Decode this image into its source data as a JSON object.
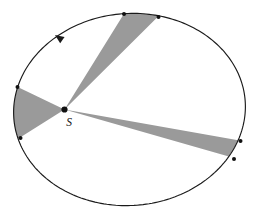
{
  "figure": {
    "type": "kepler-second-law-orbit-diagram",
    "background_color": "#ffffff"
  },
  "orbit": {
    "name": "elliptical-orbit",
    "stroke_color": "#1a1a1a",
    "stroke_width": 1.15,
    "center_x": 129.5,
    "center_y": 109.5,
    "radius_x": 116,
    "radius_y": 96,
    "rotation_deg": -4.5
  },
  "focus": {
    "label": "S",
    "label_x": 69,
    "label_y": 126,
    "dot_x": 64.5,
    "dot_y": 109.5,
    "dot_radius": 3.1,
    "dot_color": "#111111"
  },
  "direction_arrow": {
    "label": "counterclockwise-orbit-direction",
    "tip_x": 55,
    "tip_y": 35,
    "angle_deg": 215,
    "color": "#1a1a1a",
    "size": 9
  },
  "sectors": {
    "fill_color": "#9a9a9a",
    "items": [
      {
        "name": "sector-top",
        "p1_x": 124.0,
        "p1_y": 14.0,
        "p2_x": 158.5,
        "p2_y": 17.0,
        "arc_sweep": 1
      },
      {
        "name": "sector-left",
        "p1_x": 17.5,
        "p1_y": 87.0,
        "p2_x": 20.5,
        "p2_y": 138.0,
        "arc_sweep": 1
      },
      {
        "name": "sector-lower-right",
        "p1_x": 240.5,
        "p1_y": 141.0,
        "p2_x": 234.0,
        "p2_y": 159.0,
        "arc_sweep": 1
      }
    ]
  },
  "endpoint_dots": {
    "color": "#111111",
    "radius": 2.0,
    "points": [
      {
        "name": "endpoint-top-left",
        "x": 124.0,
        "y": 14.0
      },
      {
        "name": "endpoint-top-right",
        "x": 158.5,
        "y": 17.0
      },
      {
        "name": "endpoint-left-upper",
        "x": 17.5,
        "y": 87.0
      },
      {
        "name": "endpoint-left-lower",
        "x": 20.5,
        "y": 138.0
      },
      {
        "name": "endpoint-right-upper",
        "x": 240.5,
        "y": 141.0
      },
      {
        "name": "endpoint-right-lower",
        "x": 234.0,
        "y": 159.0
      }
    ]
  },
  "chart_data": {
    "type": "diagram",
    "title": "",
    "sector_count": 3,
    "focus_label": "S"
  }
}
